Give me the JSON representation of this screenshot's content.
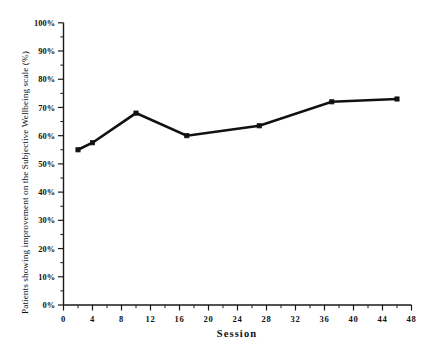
{
  "chart_data": {
    "type": "line",
    "title": "",
    "xlabel": "Session",
    "ylabel": "Patients showing improvement on the Subjective Wellbeing scale (%)",
    "xlim": [
      0,
      48
    ],
    "ylim": [
      0,
      100
    ],
    "grid": false,
    "legend": null,
    "xticks": [
      0,
      4,
      8,
      12,
      16,
      20,
      24,
      28,
      32,
      36,
      40,
      44,
      48
    ],
    "xtick_labels": [
      "0",
      "4",
      "8",
      "12",
      "16",
      "20",
      "24",
      "28",
      "32",
      "36",
      "40",
      "44",
      "48"
    ],
    "yticks": [
      0,
      10,
      20,
      30,
      40,
      50,
      60,
      70,
      80,
      90,
      100
    ],
    "ytick_labels": [
      "0%",
      "10%",
      "20%",
      "30%",
      "40%",
      "50%",
      "60%",
      "70%",
      "80%",
      "90%",
      "100%"
    ],
    "x": [
      2,
      4,
      10,
      17,
      27,
      37,
      46
    ],
    "values": [
      55,
      57.5,
      68,
      60,
      63.5,
      72,
      73
    ],
    "marker": "square",
    "line_color": "#111111",
    "marker_color": "#111111"
  }
}
